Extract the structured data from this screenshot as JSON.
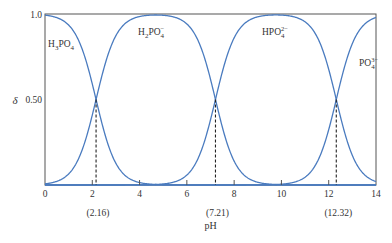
{
  "chart_data": {
    "type": "line",
    "title": "",
    "xlabel": "pH",
    "ylabel": "δ",
    "xlim": [
      0,
      14
    ],
    "ylim": [
      0,
      1.0
    ],
    "grid": false,
    "legend": "none",
    "x_ticks": [
      0,
      2,
      4,
      6,
      8,
      10,
      12,
      14
    ],
    "x_tick_labels": [
      "0",
      "2",
      "4",
      "6",
      "8",
      "10",
      "12",
      "14"
    ],
    "y_ticks": [
      0.5,
      1.0
    ],
    "y_tick_labels": [
      "0.50",
      "1.0"
    ],
    "pKa": [
      2.16,
      7.21,
      12.32
    ],
    "pKa_labels": [
      "(2.16)",
      "(7.21)",
      "(12.32)"
    ],
    "series": [
      {
        "name": "H3PO4",
        "label": "H₃PO₄",
        "charge_sup": "",
        "label_pos": "top-left",
        "color": "#4a7bbf"
      },
      {
        "name": "H2PO4-",
        "label": "H₂PO₄",
        "charge_sup": "−",
        "label_pos": "top",
        "color": "#4a7bbf"
      },
      {
        "name": "HPO4 2-",
        "label": "HPO₄",
        "charge_sup": "2−",
        "label_pos": "top",
        "color": "#4a7bbf"
      },
      {
        "name": "PO4 3-",
        "label": "PO₄",
        "charge_sup": "3−",
        "label_pos": "right",
        "color": "#4a7bbf"
      }
    ],
    "sample_points": {
      "x": [
        0,
        1,
        2,
        2.16,
        3,
        4,
        5,
        6,
        7,
        7.21,
        8,
        9,
        10,
        11,
        12,
        12.32,
        13,
        14
      ],
      "note": "curves computed from pKa values as distribution fractions of H3PO4 species"
    }
  },
  "colors": {
    "curve": "#4a7bbf",
    "axis": "#555555",
    "dashed": "#222222"
  }
}
